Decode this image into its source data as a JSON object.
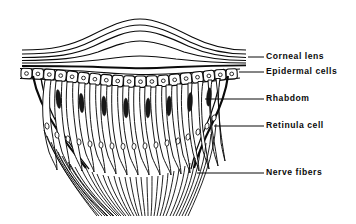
{
  "figure": {
    "background_color": "#ffffff",
    "ink_color": "#0a0a0a"
  },
  "labels": [
    {
      "id": "corneal-lens",
      "text": "Corneal lens",
      "x": 268,
      "y": 57,
      "leader_from_x": 248,
      "leader_to_x": 264,
      "leader_y": 57
    },
    {
      "id": "epidermal-cells",
      "text": "Epidermal cells",
      "x": 268,
      "y": 72,
      "leader_from_x": 239,
      "leader_to_x": 264,
      "leader_y": 72
    },
    {
      "id": "rhabdom",
      "text": "Rhabdom",
      "x": 268,
      "y": 99,
      "leader_from_x": 205,
      "leader_to_x": 264,
      "leader_y": 99
    },
    {
      "id": "retinula-cell",
      "text": "Retinula cell",
      "x": 268,
      "y": 126,
      "leader_from_x": 214,
      "leader_to_x": 264,
      "leader_y": 126
    },
    {
      "id": "nerve-fibers",
      "text": "Nerve fibers",
      "x": 268,
      "y": 173,
      "leader_from_x": 197,
      "leader_to_x": 264,
      "leader_y": 173
    }
  ],
  "structures": {
    "corneal_lens": {
      "name": "Corneal lens",
      "layer_count": 6,
      "peak_x": 140,
      "left_x": 22,
      "right_x": 246,
      "description": "Stack of six curved refractive lamellae forming a biconvex bulge"
    },
    "epidermal_cells": {
      "name": "Epidermal cells",
      "count": 19,
      "description": "Single row of rounded rectangular cells each with a central nucleus, arching downward"
    },
    "rhabdom": {
      "name": "Rhabdom",
      "count": 8,
      "description": "Dark elongated spindle-shaped photoreceptive rods at the apex of retinula cells"
    },
    "retinula_cells": {
      "name": "Retinula cell",
      "count": 17,
      "description": "Elongated tapering sensory cells each bearing an oval nucleus"
    },
    "nerve_fibers": {
      "name": "Nerve fibers",
      "count": 34,
      "description": "Converging axon bundle descending from the retinula cells"
    }
  }
}
